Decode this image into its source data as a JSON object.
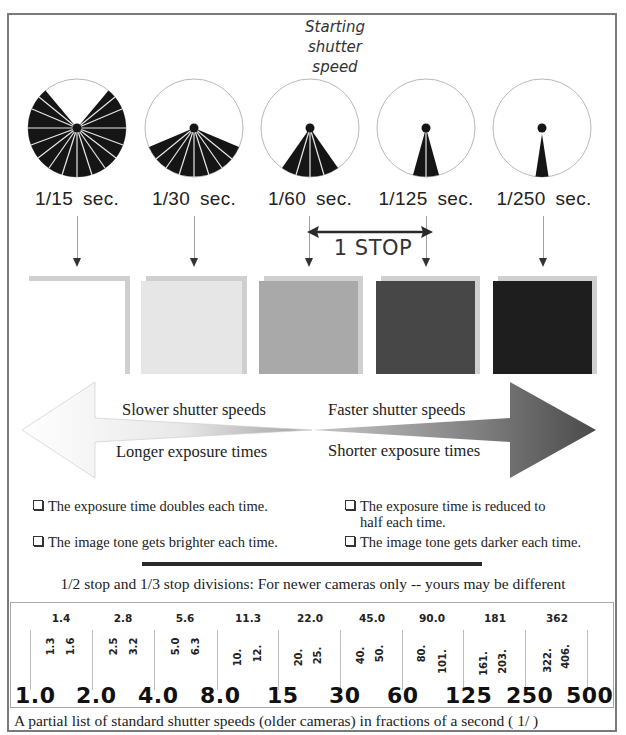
{
  "diagram": {
    "starting_label": "Starting shutter speed",
    "starting_label_lines": [
      "Starting",
      "shutter",
      "speed"
    ],
    "shutters": [
      {
        "speed": "1/15",
        "unit": "sec.",
        "blades": 16,
        "open_angle_deg": 270
      },
      {
        "speed": "1/30",
        "unit": "sec.",
        "blades": 10,
        "open_angle_deg": 135
      },
      {
        "speed": "1/60",
        "unit": "sec.",
        "blades": 4,
        "open_angle_deg": 60
      },
      {
        "speed": "1/125",
        "unit": "sec.",
        "blades": 2,
        "open_angle_deg": 30
      },
      {
        "speed": "1/250",
        "unit": "sec.",
        "blades": 1,
        "open_angle_deg": 15
      }
    ],
    "stop_label": "1 STOP",
    "swatches": [
      {
        "tone": "white",
        "color": "#ffffff"
      },
      {
        "tone": "light-gray",
        "color": "#e6e6e6"
      },
      {
        "tone": "mid-gray",
        "color": "#a9a9a9"
      },
      {
        "tone": "dark-gray",
        "color": "#474747"
      },
      {
        "tone": "near-black",
        "color": "#1e1e1e"
      }
    ],
    "arrow": {
      "left_top": "Slower shutter speeds",
      "left_bottom": "Longer exposure times",
      "right_top": "Faster shutter speeds",
      "right_bottom": "Shorter exposure times"
    },
    "bullets": {
      "left": [
        "The exposure time doubles each time.",
        "The image tone gets brighter each time."
      ],
      "right": [
        "The exposure time is reduced to half each time.",
        "The image tone gets darker each time."
      ],
      "right_0_line1": "The exposure time is reduced to",
      "right_0_line2": "half each time."
    }
  },
  "scale": {
    "title": "1/2 stop and 1/3 stop divisions: For newer cameras only -- yours may be different",
    "full_stops": [
      "1.0",
      "2.0",
      "4.0",
      "8.0",
      "15",
      "30",
      "60",
      "125",
      "250",
      "500"
    ],
    "half_stops": [
      "1.4",
      "2.8",
      "5.6",
      "11.3",
      "22.0",
      "45.0",
      "90.0",
      "181",
      "362"
    ],
    "third_stops": [
      [
        "1.3",
        "1.6"
      ],
      [
        "2.5",
        "3.2"
      ],
      [
        "5.0",
        "6.3"
      ],
      [
        "10.",
        "12."
      ],
      [
        "20.",
        "25."
      ],
      [
        "40.",
        "50."
      ],
      [
        "80.",
        "101."
      ],
      [
        "161.",
        "203."
      ],
      [
        "322.",
        "406."
      ]
    ],
    "caption": "A partial list of standard shutter speeds (older cameras) in fractions of a second ( 1/ )"
  }
}
